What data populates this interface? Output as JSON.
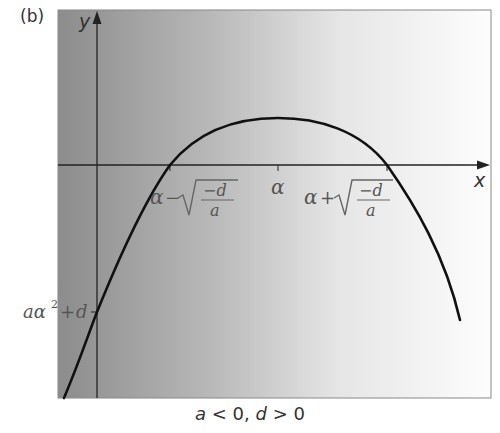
{
  "figure": {
    "panel_label": "(b)",
    "caption": "a < 0, d > 0",
    "axes": {
      "x_label": "x",
      "y_label": "y"
    },
    "labels": {
      "alpha": "α",
      "left_root": "α − √(−d/a)",
      "right_root": "α + √(−d/a)",
      "y_intercept": "aα² + d"
    },
    "colors": {
      "gradient_dark": "#8a8a8a",
      "gradient_light": "#ffffff",
      "curve": "#111111"
    }
  },
  "chart_data": {
    "type": "line",
    "title": "(b)",
    "subtitle": "a < 0, d > 0",
    "xlabel": "x",
    "ylabel": "y",
    "function": "y = a(x − α)² + d, a < 0, d > 0",
    "shape": "downward-opening parabola",
    "vertex": {
      "x": "α",
      "y": "d"
    },
    "x_intercepts": [
      "α − √(−d/a)",
      "α + √(−d/a)"
    ],
    "y_intercept": "aα² + d",
    "x_ticks": [
      "α − √(−d/a)",
      "α",
      "α + √(−d/a)"
    ],
    "y_ticks": [
      "aα² + d"
    ],
    "grid": false,
    "legend": null
  }
}
